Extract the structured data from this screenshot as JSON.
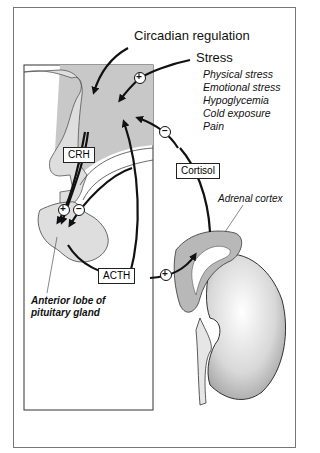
{
  "diagram": {
    "title": "Circadian regulation",
    "stress": {
      "label": "Stress",
      "factors": [
        "Physical stress",
        "Emotional stress",
        "Hypoglycemia",
        "Cold exposure",
        "Pain"
      ]
    },
    "hormones": {
      "crh": "CRH",
      "acth": "ACTH",
      "cortisol": "Cortisol"
    },
    "signs": {
      "plus": "+",
      "minus": "−"
    },
    "structures": {
      "adrenal_cortex": "Adrenal cortex",
      "pituitary_line1": "Anterior lobe of",
      "pituitary_line2": "pituitary gland"
    },
    "colors": {
      "hypothalamus_fill": "#c8c8c8",
      "tissue_fill": "#dcdcdc",
      "adrenal_fill": "#b8b8b8",
      "line": "#111111"
    }
  }
}
